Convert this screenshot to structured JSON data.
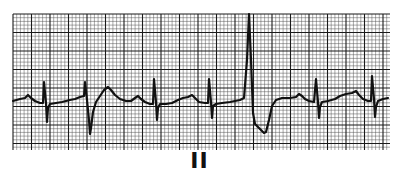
{
  "lead_label": "II",
  "colors": {
    "paper": "#ffffff",
    "grid_minor": "#555555",
    "grid_major": "#1a1a1a",
    "trace": "#111111"
  },
  "chart_data": {
    "type": "line",
    "lead": "II",
    "xlabel": "",
    "ylabel": "",
    "grid": true,
    "legend": null,
    "plot_area_px": {
      "x0": 13,
      "y0": 14,
      "x1": 390,
      "y1": 150
    },
    "grid_px": {
      "minor": 3.7,
      "major": 18.5
    },
    "beats": [
      {
        "type": "normal",
        "r_x": 44,
        "label": "QRS"
      },
      {
        "type": "ventricular-premature",
        "r_x": 85,
        "label": "PVC (wide, negative S)"
      },
      {
        "type": "normal",
        "r_x": 154,
        "label": "QRS"
      },
      {
        "type": "normal",
        "r_x": 209,
        "label": "QRS"
      },
      {
        "type": "ventricular-premature",
        "r_x": 249,
        "label": "PVC (tall R)"
      },
      {
        "type": "normal",
        "r_x": 316,
        "label": "QRS"
      },
      {
        "type": "normal",
        "r_x": 372,
        "label": "QRS"
      }
    ],
    "trace_points": [
      [
        13,
        101
      ],
      [
        20,
        99
      ],
      [
        25,
        98
      ],
      [
        28,
        95
      ],
      [
        31,
        98
      ],
      [
        35,
        101
      ],
      [
        40,
        103
      ],
      [
        43,
        103
      ],
      [
        44,
        82
      ],
      [
        46,
        103
      ],
      [
        47,
        122
      ],
      [
        48,
        108
      ],
      [
        50,
        104
      ],
      [
        56,
        103
      ],
      [
        62,
        102
      ],
      [
        70,
        100
      ],
      [
        75,
        99
      ],
      [
        80,
        97
      ],
      [
        84,
        96
      ],
      [
        85,
        82
      ],
      [
        87,
        100
      ],
      [
        89,
        120
      ],
      [
        90,
        134
      ],
      [
        91,
        128
      ],
      [
        93,
        112
      ],
      [
        96,
        102
      ],
      [
        100,
        96
      ],
      [
        104,
        90
      ],
      [
        108,
        87
      ],
      [
        111,
        90
      ],
      [
        115,
        95
      ],
      [
        120,
        99
      ],
      [
        126,
        101
      ],
      [
        131,
        101
      ],
      [
        135,
        98
      ],
      [
        138,
        96
      ],
      [
        141,
        99
      ],
      [
        145,
        102
      ],
      [
        150,
        104
      ],
      [
        153,
        104
      ],
      [
        154,
        79
      ],
      [
        156,
        102
      ],
      [
        157,
        120
      ],
      [
        158,
        108
      ],
      [
        160,
        104
      ],
      [
        166,
        104
      ],
      [
        172,
        103
      ],
      [
        178,
        100
      ],
      [
        183,
        98
      ],
      [
        188,
        97
      ],
      [
        192,
        95
      ],
      [
        195,
        98
      ],
      [
        199,
        102
      ],
      [
        205,
        103
      ],
      [
        208,
        103
      ],
      [
        209,
        79
      ],
      [
        211,
        102
      ],
      [
        212,
        118
      ],
      [
        213,
        106
      ],
      [
        216,
        104
      ],
      [
        222,
        103
      ],
      [
        230,
        102
      ],
      [
        240,
        100
      ],
      [
        244,
        98
      ],
      [
        247,
        60
      ],
      [
        249,
        14
      ],
      [
        251,
        60
      ],
      [
        253,
        113
      ],
      [
        255,
        124
      ],
      [
        259,
        128
      ],
      [
        264,
        133
      ],
      [
        266,
        132
      ],
      [
        269,
        120
      ],
      [
        272,
        106
      ],
      [
        276,
        100
      ],
      [
        282,
        98
      ],
      [
        290,
        98
      ],
      [
        296,
        97
      ],
      [
        299,
        94
      ],
      [
        302,
        96
      ],
      [
        305,
        99
      ],
      [
        309,
        101
      ],
      [
        314,
        102
      ],
      [
        316,
        79
      ],
      [
        318,
        102
      ],
      [
        319,
        118
      ],
      [
        320,
        107
      ],
      [
        322,
        102
      ],
      [
        328,
        101
      ],
      [
        335,
        99
      ],
      [
        340,
        96
      ],
      [
        346,
        94
      ],
      [
        352,
        93
      ],
      [
        356,
        91
      ],
      [
        359,
        95
      ],
      [
        363,
        99
      ],
      [
        368,
        101
      ],
      [
        371,
        101
      ],
      [
        372,
        76
      ],
      [
        374,
        99
      ],
      [
        375,
        117
      ],
      [
        376,
        107
      ],
      [
        378,
        101
      ],
      [
        383,
        99
      ],
      [
        388,
        98
      ]
    ]
  }
}
